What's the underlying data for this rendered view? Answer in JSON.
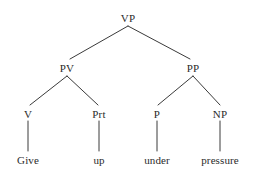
{
  "figure": {
    "name": "phrase-structure-tree",
    "sentence": "Give up under pressure",
    "background_color": "#ffffff",
    "line_color": "#3a3a3a",
    "text_color": "#2b2b2b"
  },
  "nodes": {
    "root": {
      "label": "VP",
      "x": 128,
      "y": 18
    },
    "pv": {
      "label": "PV",
      "x": 67,
      "y": 68
    },
    "pp": {
      "label": "PP",
      "x": 193,
      "y": 68
    },
    "v": {
      "label": "V",
      "x": 28,
      "y": 114
    },
    "prt": {
      "label": "Prt",
      "x": 99,
      "y": 114
    },
    "p": {
      "label": "P",
      "x": 157,
      "y": 114
    },
    "np": {
      "label": "NP",
      "x": 220,
      "y": 114
    }
  },
  "terminals": {
    "give": {
      "label": "Give",
      "x": 28,
      "y": 160
    },
    "up": {
      "label": "up",
      "x": 99,
      "y": 160
    },
    "under": {
      "label": "under",
      "x": 157,
      "y": 160
    },
    "pressure": {
      "label": "pressure",
      "x": 220,
      "y": 160
    }
  },
  "edges": [
    {
      "name": "edge-vp-pv",
      "from": "VP",
      "to": "PV",
      "x1": 128,
      "y1": 26,
      "x2": 70,
      "y2": 59
    },
    {
      "name": "edge-vp-pp",
      "from": "VP",
      "to": "PP",
      "x1": 128,
      "y1": 26,
      "x2": 190,
      "y2": 59
    },
    {
      "name": "edge-pv-v",
      "from": "PV",
      "to": "V",
      "x1": 67,
      "y1": 76,
      "x2": 30,
      "y2": 105
    },
    {
      "name": "edge-pv-prt",
      "from": "PV",
      "to": "Prt",
      "x1": 67,
      "y1": 76,
      "x2": 98,
      "y2": 105
    },
    {
      "name": "edge-pp-p",
      "from": "PP",
      "to": "P",
      "x1": 193,
      "y1": 76,
      "x2": 158,
      "y2": 105
    },
    {
      "name": "edge-pp-np",
      "from": "PP",
      "to": "NP",
      "x1": 193,
      "y1": 76,
      "x2": 220,
      "y2": 105
    },
    {
      "name": "edge-v-give",
      "from": "V",
      "to": "Give",
      "x1": 28,
      "y1": 121,
      "x2": 28,
      "y2": 151
    },
    {
      "name": "edge-prt-up",
      "from": "Prt",
      "to": "up",
      "x1": 99,
      "y1": 121,
      "x2": 99,
      "y2": 151
    },
    {
      "name": "edge-p-under",
      "from": "P",
      "to": "under",
      "x1": 157,
      "y1": 121,
      "x2": 157,
      "y2": 151
    },
    {
      "name": "edge-np-pressure",
      "from": "NP",
      "to": "pressure",
      "x1": 220,
      "y1": 121,
      "x2": 220,
      "y2": 151
    }
  ]
}
